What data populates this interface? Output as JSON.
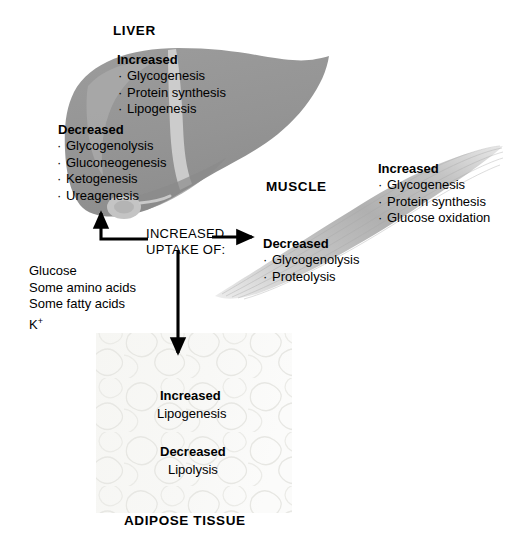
{
  "diagram": {
    "background": "#ffffff"
  },
  "colors": {
    "liver_body": "#949494",
    "liver_light": "#c9c9c9",
    "liver_dark": "#848484",
    "gallbladder": "#c2c2c2",
    "muscle_body": "#b4b4b4",
    "muscle_light": "#dcdcdc",
    "adipose_bg": "#f7f7f5",
    "adipose_line": "#e3e3e0",
    "arrow": "#000000",
    "text": "#000000"
  },
  "liver": {
    "label": "LIVER",
    "increased": {
      "header": "Increased",
      "items": [
        "Glycogenesis",
        "Protein synthesis",
        "Lipogenesis"
      ]
    },
    "decreased": {
      "header": "Decreased",
      "items": [
        "Glycogenolysis",
        "Gluconeogenesis",
        "Ketogenesis",
        "Ureagenesis"
      ]
    }
  },
  "muscle": {
    "label": "MUSCLE",
    "increased": {
      "header": "Increased",
      "items": [
        "Glycogenesis",
        "Protein synthesis",
        "Glucose oxidation"
      ]
    },
    "decreased": {
      "header": "Decreased",
      "items": [
        "Glycogenolysis",
        "Proteolysis"
      ]
    }
  },
  "adipose": {
    "label": "ADIPOSE TISSUE",
    "increased": {
      "header": "Increased",
      "items": [
        "Lipogenesis"
      ]
    },
    "decreased": {
      "header": "Decreased",
      "items": [
        "Lipolysis"
      ]
    }
  },
  "uptake": {
    "heading_line1": "INCREASED",
    "heading_line2": "UPTAKE OF:",
    "substances": [
      "Glucose",
      "Some amino acids",
      "Some fatty acids",
      "K"
    ],
    "potassium_superscript": "+"
  },
  "arrows": {
    "to_liver": "arrow-up-to-liver",
    "to_muscle": "arrow-right-to-muscle",
    "to_adipose": "arrow-down-to-adipose"
  },
  "bullet_glyph": "·"
}
